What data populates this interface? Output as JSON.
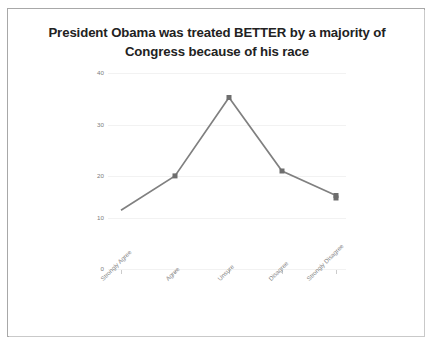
{
  "chart_data": {
    "type": "line",
    "title": "President Obama was treated BETTER by a majority of Congress because of his race",
    "title_lines": [
      "President Obama was treated BETTER by a majority of",
      "Congress because of his race"
    ],
    "xlabel": "",
    "ylabel": "",
    "categories": [
      "Strongly Agree",
      "Agree",
      "Unsure",
      "Disagree",
      "Strongly Disagree"
    ],
    "values": [
      12,
      19,
      35,
      20,
      15
    ],
    "series": [
      {
        "name": "Responses",
        "values": [
          12,
          19,
          35,
          20,
          15
        ]
      }
    ],
    "ylim": [
      0,
      40
    ],
    "yticks": [
      0,
      10,
      20,
      30,
      40
    ],
    "ytick_labels": [
      "0",
      "10",
      "20",
      "30",
      "40"
    ],
    "grid": true,
    "grid_axis": "y",
    "legend": false,
    "legend_position": "none",
    "markers": true,
    "line_color": "#808080",
    "marker_color": "#6e6e6e",
    "grid_color": "#f2f2f2",
    "tick_label_color": "#8a8a8a",
    "title_color": "#222222",
    "xtick_rotation": -45
  },
  "frame": {
    "border_color": "#a8a8a8",
    "background": "#ffffff"
  }
}
